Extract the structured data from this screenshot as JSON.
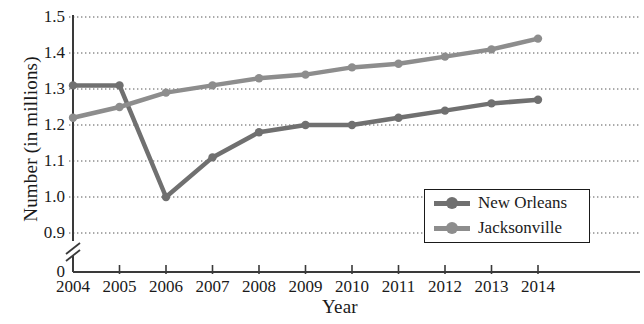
{
  "chart_data": {
    "type": "line",
    "title": "",
    "xlabel": "Year",
    "ylabel": "Number (in millions)",
    "categories": [
      2004,
      2005,
      2006,
      2007,
      2008,
      2009,
      2010,
      2011,
      2012,
      2013,
      2014
    ],
    "x_tick_labels": [
      "2004",
      "2005",
      "2006",
      "2007",
      "2008",
      "2009",
      "2010",
      "2011",
      "2012",
      "2013",
      "2014"
    ],
    "y_tick_labels": [
      "0",
      "0.9",
      "1.0",
      "1.1",
      "1.2",
      "1.3",
      "1.4",
      "1.5"
    ],
    "y_tick_values": [
      0,
      0.9,
      1.0,
      1.1,
      1.2,
      1.3,
      1.4,
      1.5
    ],
    "ylim": [
      0.9,
      1.5
    ],
    "axis_break": true,
    "axis_break_label": "0",
    "grid": true,
    "grid_style": "dotted-horizontal",
    "legend_position": "inside-bottom-right",
    "series": [
      {
        "name": "New Orleans",
        "color": "#707070",
        "values": [
          1.31,
          1.31,
          1.0,
          1.11,
          1.18,
          1.2,
          1.2,
          1.22,
          1.24,
          1.26,
          1.27
        ]
      },
      {
        "name": "Jacksonville",
        "color": "#8d8d8d",
        "values": [
          1.22,
          1.25,
          1.29,
          1.31,
          1.33,
          1.34,
          1.36,
          1.37,
          1.39,
          1.41,
          1.44
        ]
      }
    ],
    "axis_color": "#3a3a3a",
    "grid_color": "#555555",
    "background": "#ffffff"
  },
  "legend": {
    "items": [
      {
        "label": "New Orleans"
      },
      {
        "label": "Jacksonville"
      }
    ]
  }
}
